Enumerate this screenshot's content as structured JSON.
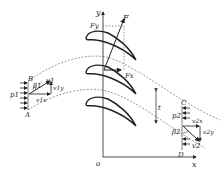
{
  "diagram": {
    "axes": {
      "x_label": "x",
      "y_label": "y",
      "origin_label": "o"
    },
    "forces": {
      "F": "F",
      "Fx": "Fx",
      "Fy": "Fy"
    },
    "inlet": {
      "pressure": "p1",
      "angle": "β1",
      "velocity": "v1",
      "vx": "v1x",
      "vy": "v1y",
      "corner_top": "B",
      "corner_bottom": "A"
    },
    "outlet": {
      "pressure": "p2",
      "angle": "β2",
      "velocity": "v2",
      "vx": "v2x",
      "vy": "v2y",
      "corner_top": "C",
      "corner_bottom": "D"
    },
    "pitch_label": "t",
    "colors": {
      "stroke": "#222222",
      "dashed": "#555555",
      "background": "#ffffff"
    }
  }
}
